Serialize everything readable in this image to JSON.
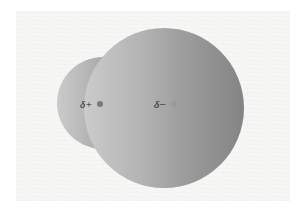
{
  "figure": {
    "background_color": "#f7f7f5",
    "canvas": {
      "width": 301,
      "height": 210
    }
  },
  "atoms": [
    {
      "id": "small-atom",
      "charge_label": "δ+",
      "center": {
        "x": 103,
        "y": 103
      },
      "radius": 46,
      "nucleus_dot": {
        "x": 100,
        "y": 104,
        "r": 3,
        "color": "#7a7a7a"
      }
    },
    {
      "id": "large-atom",
      "charge_label": "δ−",
      "center": {
        "x": 164,
        "y": 108
      },
      "radius": 80,
      "nucleus_dot": {
        "x": 174,
        "y": 104,
        "r": 3,
        "color": "#9b9b9b"
      }
    }
  ],
  "electron_cloud": {
    "gradient_type": "linear-horizontal",
    "stops": [
      {
        "offset": "0%",
        "color": "#cbcbcb"
      },
      {
        "offset": "35%",
        "color": "#b4b4b4"
      },
      {
        "offset": "62%",
        "color": "#9d9d9d"
      },
      {
        "offset": "100%",
        "color": "#848484"
      }
    ],
    "edge_color": "#8d8d8d"
  }
}
